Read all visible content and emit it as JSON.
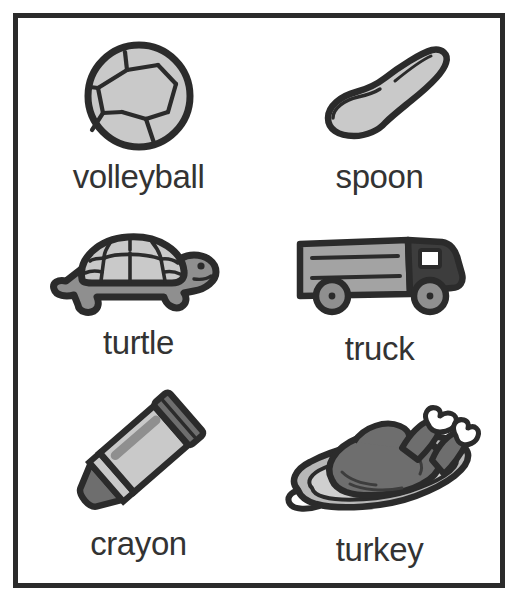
{
  "document": {
    "type": "picture-word vocabulary card sheet",
    "background_color": "#ffffff",
    "frame_color": "#2b2b2b",
    "columns": 2,
    "rows": 3
  },
  "palette": {
    "outline": "#2b2b2b",
    "ink": "#333333",
    "light_gray": "#c9c9c9",
    "mid_gray": "#a3a3a3",
    "dark_gray": "#6e6e6e",
    "darkest_gray": "#3d3d3d",
    "white": "#ffffff"
  },
  "cards": [
    {
      "id": "volleyball",
      "label": "volleyball",
      "icon": "volleyball-icon",
      "row": 1,
      "column": 1
    },
    {
      "id": "spoon",
      "label": "spoon",
      "icon": "spoon-icon",
      "row": 1,
      "column": 2
    },
    {
      "id": "turtle",
      "label": "turtle",
      "icon": "turtle-icon",
      "row": 2,
      "column": 1
    },
    {
      "id": "truck",
      "label": "truck",
      "icon": "truck-icon",
      "row": 2,
      "column": 2
    },
    {
      "id": "crayon",
      "label": "crayon",
      "icon": "crayon-icon",
      "row": 3,
      "column": 1
    },
    {
      "id": "turkey",
      "label": "turkey",
      "icon": "turkey-icon",
      "row": 3,
      "column": 2
    }
  ]
}
